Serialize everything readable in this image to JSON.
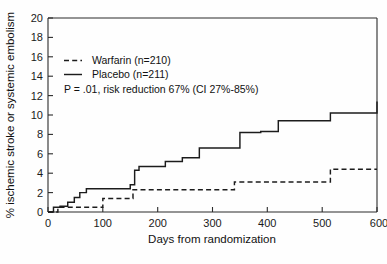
{
  "chart_data": {
    "type": "line",
    "title": "",
    "xlabel": "Days from randomization",
    "ylabel": "% ischemic stroke or systemic embolism",
    "xlim": [
      0,
      600
    ],
    "ylim": [
      0,
      20
    ],
    "xticks": [
      "0",
      "100",
      "200",
      "300",
      "400",
      "500",
      "600"
    ],
    "xtick_values": [
      0,
      100,
      200,
      300,
      400,
      500,
      600
    ],
    "yticks": [
      "0",
      "2",
      "4",
      "6",
      "8",
      "10",
      "12",
      "14",
      "16",
      "18",
      "20"
    ],
    "ytick_values": [
      0,
      2,
      4,
      6,
      8,
      10,
      12,
      14,
      16,
      18,
      20
    ],
    "grid": false,
    "legend_position": "upper-left",
    "step_type": "post",
    "series": [
      {
        "name": "Warfarin (n=210)",
        "label": "Warfarin (n=210)",
        "style": "dashed",
        "color": "#1c1c1c",
        "x": [
          0,
          18,
          100,
          155,
          340,
          515,
          600
        ],
        "values": [
          0,
          0.5,
          1.4,
          2.3,
          3.1,
          4.4,
          4.4
        ]
      },
      {
        "name": "Placebo (n=211)",
        "label": "Placebo (n=211)",
        "style": "solid",
        "color": "#1c1c1c",
        "x": [
          0,
          10,
          22,
          36,
          48,
          58,
          70,
          150,
          158,
          166,
          186,
          214,
          245,
          276,
          350,
          388,
          420,
          515,
          600
        ],
        "values": [
          0,
          0.5,
          0.6,
          1.0,
          1.5,
          2.0,
          2.4,
          2.8,
          4.3,
          4.7,
          4.7,
          5.2,
          5.6,
          6.6,
          8.2,
          8.3,
          9.4,
          10.2,
          11.4
        ]
      }
    ],
    "annotations": [
      {
        "id": "stats-annotation",
        "text": "P = .01, risk reduction 67% (CI 27%-85%)"
      }
    ]
  },
  "legend": {
    "items": [
      {
        "label": "Warfarin (n=210)",
        "style": "dashed"
      },
      {
        "label": "Placebo (n=211)",
        "style": "solid"
      }
    ]
  },
  "annotation": {
    "stats": "P = .01, risk reduction 67% (CI 27%-85%)"
  },
  "axes": {
    "x_title": "Days from randomization",
    "y_title": "% ischemic stroke or systemic embolism"
  }
}
